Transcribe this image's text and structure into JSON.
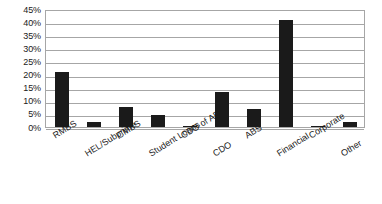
{
  "chart_data": {
    "type": "bar",
    "title": "",
    "subtitle": "",
    "xlabel": "",
    "ylabel": "",
    "ylim": [
      0,
      45
    ],
    "ytick_step": 5,
    "ytick_labels": [
      "0%",
      "5%",
      "10%",
      "15%",
      "20%",
      "25%",
      "30%",
      "35%",
      "40%",
      "45%"
    ],
    "ytick_values": [
      0,
      5,
      10,
      15,
      20,
      25,
      30,
      35,
      40,
      45
    ],
    "grid": "horizontal",
    "legend": "none",
    "value_unit": "%",
    "bar_color": "#1a1a1a",
    "gridline_color": "#a6a6a6",
    "background_color": "#ffffff",
    "categories": [
      "RMBS",
      "HEL/Subprime",
      "CMBS",
      "Student Loans",
      "CDO of ABS",
      "CDO",
      "ABS",
      "Financial",
      "Corporate",
      "Other"
    ],
    "values": [
      21,
      2,
      7.5,
      4.7,
      0.3,
      13.5,
      7,
      41,
      0.3,
      2
    ],
    "series": [
      {
        "name": "",
        "values": [
          21,
          2,
          7.5,
          4.7,
          0.3,
          13.5,
          7,
          41,
          0.3,
          2
        ]
      }
    ]
  }
}
